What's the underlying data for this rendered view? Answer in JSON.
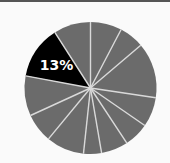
{
  "chart_data": {
    "type": "pie",
    "title": "",
    "start_angle_deg": 0,
    "direction": "clockwise",
    "center": [
      90.5,
      88
    ],
    "radius": 66,
    "slices": [
      {
        "value": 7.7,
        "color": "#6b6b6b",
        "label": ""
      },
      {
        "value": 6.1,
        "color": "#6b6b6b",
        "label": ""
      },
      {
        "value": 13.6,
        "color": "#6b6b6b",
        "label": ""
      },
      {
        "value": 7.3,
        "color": "#6b6b6b",
        "label": ""
      },
      {
        "value": 6.1,
        "color": "#6b6b6b",
        "label": ""
      },
      {
        "value": 6.6,
        "color": "#6b6b6b",
        "label": ""
      },
      {
        "value": 4.4,
        "color": "#6b6b6b",
        "label": ""
      },
      {
        "value": 9.3,
        "color": "#6b6b6b",
        "label": ""
      },
      {
        "value": 7.2,
        "color": "#6b6b6b",
        "label": ""
      },
      {
        "value": 9.8,
        "color": "#6b6b6b",
        "label": ""
      },
      {
        "value": 13.0,
        "color": "#000000",
        "label": "13%",
        "highlighted": true
      },
      {
        "value": 9.1,
        "color": "#6b6b6b",
        "label": ""
      }
    ],
    "highlight_label": "13%",
    "separator_color": "#d9d9d9",
    "legend": "none"
  }
}
